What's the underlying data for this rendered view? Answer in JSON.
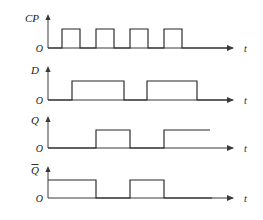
{
  "figure": {
    "kind": "digital-timing-diagram",
    "title": "",
    "background_color": "#ffffff",
    "line_color": "#262626",
    "axis_color": "#3a3a3a",
    "time_axis_label": "t",
    "origin_label": "O",
    "rows": [
      {
        "id": "cp",
        "name": "clock-waveform",
        "label": "CP",
        "label_has_overbar": false,
        "origin_label": "O",
        "time_label": "t",
        "baseline_y": 48,
        "high_y": 29,
        "axis_x": 48,
        "axis_top_y": 14,
        "axis_end_x": 232,
        "arrow_tip_x": 240,
        "start_level": 0,
        "transitions": [
          {
            "x": 62,
            "level": 1
          },
          {
            "x": 80,
            "level": 0
          },
          {
            "x": 96,
            "level": 1
          },
          {
            "x": 114,
            "level": 0
          },
          {
            "x": 130,
            "level": 1
          },
          {
            "x": 148,
            "level": 0
          },
          {
            "x": 164,
            "level": 1
          },
          {
            "x": 182,
            "level": 0
          }
        ],
        "end_x": 228
      },
      {
        "id": "d",
        "name": "data-input-waveform",
        "label": "D",
        "label_has_overbar": false,
        "origin_label": "O",
        "time_label": "t",
        "baseline_y": 100,
        "high_y": 81,
        "axis_x": 48,
        "axis_top_y": 66,
        "axis_end_x": 232,
        "arrow_tip_x": 240,
        "start_level": 0,
        "transitions": [
          {
            "x": 72,
            "level": 1
          },
          {
            "x": 124,
            "level": 0
          },
          {
            "x": 147,
            "level": 1
          },
          {
            "x": 197,
            "level": 0
          }
        ],
        "end_x": 228
      },
      {
        "id": "q",
        "name": "q-output-waveform",
        "label": "Q",
        "label_has_overbar": false,
        "origin_label": "O",
        "time_label": "t",
        "baseline_y": 148,
        "high_y": 130,
        "axis_x": 48,
        "axis_top_y": 116,
        "axis_end_x": 232,
        "arrow_tip_x": 240,
        "start_level": 0,
        "transitions": [
          {
            "x": 96,
            "level": 1
          },
          {
            "x": 130,
            "level": 0
          },
          {
            "x": 164,
            "level": 1
          }
        ],
        "end_x": 210
      },
      {
        "id": "qbar",
        "name": "q-bar-output-waveform",
        "label": "Q",
        "label_has_overbar": true,
        "origin_label": "O",
        "time_label": "t",
        "baseline_y": 198,
        "high_y": 180,
        "axis_x": 48,
        "axis_top_y": 166,
        "axis_end_x": 232,
        "arrow_tip_x": 240,
        "start_level": 1,
        "transitions": [
          {
            "x": 96,
            "level": 0
          },
          {
            "x": 130,
            "level": 1
          },
          {
            "x": 164,
            "level": 0
          }
        ],
        "end_x": 212
      }
    ]
  },
  "chart_data": {
    "type": "line",
    "xlabel": "t",
    "ylabel": "",
    "grid": false,
    "legend_position": "none",
    "x_range": [
      0,
      185
    ],
    "y_levels": [
      0,
      1
    ],
    "series": [
      {
        "name": "CP",
        "description": "Clock, four positive pulses",
        "points": [
          {
            "t": 0,
            "v": 0
          },
          {
            "t": 14,
            "v": 0
          },
          {
            "t": 14,
            "v": 1
          },
          {
            "t": 32,
            "v": 1
          },
          {
            "t": 32,
            "v": 0
          },
          {
            "t": 48,
            "v": 0
          },
          {
            "t": 48,
            "v": 1
          },
          {
            "t": 66,
            "v": 1
          },
          {
            "t": 66,
            "v": 0
          },
          {
            "t": 82,
            "v": 0
          },
          {
            "t": 82,
            "v": 1
          },
          {
            "t": 100,
            "v": 1
          },
          {
            "t": 100,
            "v": 0
          },
          {
            "t": 116,
            "v": 0
          },
          {
            "t": 116,
            "v": 1
          },
          {
            "t": 134,
            "v": 1
          },
          {
            "t": 134,
            "v": 0
          },
          {
            "t": 180,
            "v": 0
          }
        ]
      },
      {
        "name": "D",
        "description": "Data input, two wide pulses",
        "points": [
          {
            "t": 0,
            "v": 0
          },
          {
            "t": 24,
            "v": 0
          },
          {
            "t": 24,
            "v": 1
          },
          {
            "t": 76,
            "v": 1
          },
          {
            "t": 76,
            "v": 0
          },
          {
            "t": 99,
            "v": 0
          },
          {
            "t": 99,
            "v": 1
          },
          {
            "t": 149,
            "v": 1
          },
          {
            "t": 149,
            "v": 0
          },
          {
            "t": 180,
            "v": 0
          }
        ]
      },
      {
        "name": "Q",
        "description": "Output follows D on clock edge",
        "points": [
          {
            "t": 0,
            "v": 0
          },
          {
            "t": 48,
            "v": 0
          },
          {
            "t": 48,
            "v": 1
          },
          {
            "t": 82,
            "v": 1
          },
          {
            "t": 82,
            "v": 0
          },
          {
            "t": 116,
            "v": 0
          },
          {
            "t": 116,
            "v": 1
          },
          {
            "t": 162,
            "v": 1
          }
        ]
      },
      {
        "name": "Q-bar",
        "description": "Complement of Q",
        "points": [
          {
            "t": 0,
            "v": 1
          },
          {
            "t": 48,
            "v": 1
          },
          {
            "t": 48,
            "v": 0
          },
          {
            "t": 82,
            "v": 0
          },
          {
            "t": 82,
            "v": 1
          },
          {
            "t": 116,
            "v": 1
          },
          {
            "t": 116,
            "v": 0
          },
          {
            "t": 164,
            "v": 0
          }
        ]
      }
    ]
  }
}
